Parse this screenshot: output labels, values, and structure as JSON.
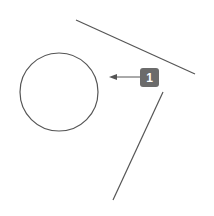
{
  "diagram": {
    "shapes": [
      {
        "type": "circle",
        "cx": 59,
        "cy": 92,
        "r": 39
      },
      {
        "type": "line",
        "x1": 76,
        "y1": 20,
        "x2": 195,
        "y2": 74
      },
      {
        "type": "line",
        "x1": 163,
        "y1": 92,
        "x2": 113,
        "y2": 200
      }
    ],
    "callout": {
      "label": "1",
      "arrow_from": [
        140,
        77
      ],
      "arrow_to": [
        110,
        77
      ]
    },
    "colors": {
      "stroke": "#555555",
      "label_bg": "#6b6b6b",
      "label_text": "#ffffff"
    }
  }
}
